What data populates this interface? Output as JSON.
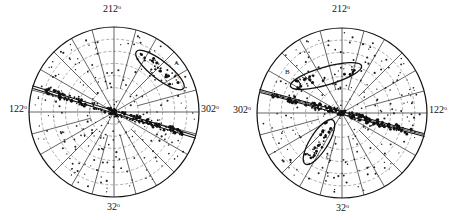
{
  "figure": {
    "panels": [
      {
        "id": "left",
        "labels": {
          "top": "212",
          "bottom": "32",
          "left": "122",
          "right": "302",
          "degree": "o"
        },
        "annotations": [
          "A"
        ],
        "center": [
          114,
          112
        ],
        "radius": 85,
        "band_angle_deg": -17,
        "ellipses": [
          {
            "label": "A",
            "cx": 160,
            "cy": 70,
            "rx": 30,
            "ry": 9,
            "rot": 38
          }
        ]
      },
      {
        "id": "right",
        "labels": {
          "top": "212",
          "bottom": "32",
          "left": "302",
          "right": "122",
          "degree": "o"
        },
        "annotations": [
          "B",
          "C"
        ],
        "center": [
          342,
          113
        ],
        "radius": 85,
        "band_angle_deg": -15,
        "ellipses": [
          {
            "label": "B",
            "cx": 326,
            "cy": 76,
            "rx": 37,
            "ry": 9,
            "rot": -16
          },
          {
            "label": "C",
            "cx": 319,
            "cy": 142,
            "rx": 26,
            "ry": 9,
            "rot": -58
          }
        ]
      }
    ]
  }
}
